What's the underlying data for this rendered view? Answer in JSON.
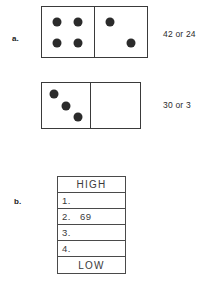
{
  "worksheet": {
    "problems": [
      {
        "label": "a.",
        "dominoes": [
          {
            "name": "domino-top",
            "left_pips": 4,
            "right_pips": 2,
            "left_layout": [
              "p-tl",
              "p-tr",
              "p-bl",
              "p-br"
            ],
            "right_layout": [
              "p-tl",
              "p-br"
            ]
          },
          {
            "name": "domino-bottom",
            "left_pips": 3,
            "right_pips": 0,
            "left_layout": [
              "p-d1",
              "p-d2",
              "p-d3"
            ],
            "right_layout": []
          }
        ],
        "answers": [
          {
            "name": "answer-top",
            "text": "42 or 24"
          },
          {
            "name": "answer-bottom",
            "text": "30 or 3"
          }
        ]
      },
      {
        "label": "b.",
        "table": {
          "header_label": "HIGH",
          "footer_label": "LOW",
          "rows": [
            {
              "number": "1.",
              "value": ""
            },
            {
              "number": "2.",
              "value": "69"
            },
            {
              "number": "3.",
              "value": ""
            },
            {
              "number": "4.",
              "value": ""
            }
          ]
        }
      }
    ]
  },
  "colors": {
    "ink": "#2b2b2b",
    "rule": "#4a4a4a",
    "paper": "#ffffff"
  }
}
